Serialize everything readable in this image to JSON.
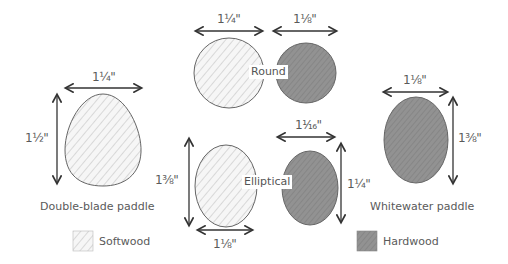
{
  "diagram": {
    "groups": {
      "round": {
        "label": "Round"
      },
      "elliptical": {
        "label": "Elliptical"
      }
    },
    "shapes": {
      "double_blade": {
        "caption": "Double-blade paddle",
        "width": "1¼\"",
        "height": "1½\"",
        "material": "Softwood"
      },
      "round_softwood": {
        "width": "1¼\"",
        "material": "Softwood"
      },
      "round_hardwood": {
        "width": "1⅛\"",
        "material": "Hardwood"
      },
      "elliptical_softwood": {
        "width": "1⅛\"",
        "height": "1⅜\"",
        "material": "Softwood"
      },
      "elliptical_hardwood": {
        "width": "1¹⁄₁₆\"",
        "height": "1¼\"",
        "material": "Hardwood"
      },
      "whitewater": {
        "caption": "Whitewater paddle",
        "width": "1⅛\"",
        "height": "1⅜\"",
        "material": "Hardwood"
      }
    },
    "legend": [
      {
        "label": "Softwood",
        "fill": "#f4f4f4",
        "stroke": "#9a9a9a"
      },
      {
        "label": "Hardwood",
        "fill": "#8f8f8f",
        "stroke": "#6a6a6a"
      }
    ],
    "colors": {
      "line": "#333333",
      "outline": "#555555",
      "softwood": "#f4f4f4",
      "hardwood": "#8f8f8f"
    }
  }
}
